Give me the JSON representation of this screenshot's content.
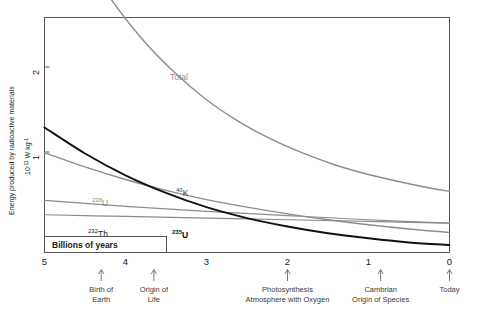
{
  "chart_data": {
    "type": "line",
    "title": "",
    "xlabel": "Billions of years",
    "ylabel": "Energy produced by radioactive materials",
    "ylabel_unit": "10 -11 W kg -1",
    "ylabel_unit_base": "10",
    "ylabel_unit_exp1": "-11",
    "ylabel_unit_mid": " W kg",
    "ylabel_unit_exp2": "-1",
    "x_direction": "decreasing",
    "xlim": [
      5,
      0
    ],
    "ylim": [
      0,
      2.8
    ],
    "xticks": [
      "5",
      "4",
      "3",
      "2",
      "1",
      "0"
    ],
    "xtick_values": [
      5,
      4,
      3,
      2,
      1,
      0
    ],
    "yticks": [
      "1",
      "2"
    ],
    "ytick_values": [
      1,
      2
    ],
    "grid": false,
    "legend": "inline-labels",
    "series": [
      {
        "name": "Total",
        "label": "Total",
        "color": "#8c8c8c",
        "width": 1.4,
        "x": [
          5.0,
          4.6,
          4.2,
          3.8,
          3.4,
          3.0,
          2.6,
          2.2,
          1.8,
          1.4,
          1.0,
          0.6,
          0.2,
          0.0
        ],
        "y": [
          4.55,
          3.7,
          3.05,
          2.55,
          2.15,
          1.82,
          1.56,
          1.35,
          1.18,
          1.04,
          0.93,
          0.84,
          0.76,
          0.73
        ]
      },
      {
        "name": "K-40",
        "label": "40 K",
        "label_sup": "40",
        "label_base": "K",
        "color": "#8c8c8c",
        "width": 1.4,
        "x": [
          5.0,
          4.5,
          4.0,
          3.5,
          3.0,
          2.5,
          2.0,
          1.5,
          1.0,
          0.5,
          0.0
        ],
        "y": [
          1.19,
          1.02,
          0.87,
          0.74,
          0.63,
          0.54,
          0.46,
          0.39,
          0.33,
          0.28,
          0.24
        ]
      },
      {
        "name": "U-235",
        "label": "235 U",
        "label_sup": "235",
        "label_base": "U",
        "color": "#111111",
        "width": 1.9,
        "x": [
          5.0,
          4.5,
          4.0,
          3.5,
          3.0,
          2.5,
          2.0,
          1.5,
          1.0,
          0.5,
          0.0
        ],
        "y": [
          1.49,
          1.18,
          0.92,
          0.71,
          0.54,
          0.41,
          0.31,
          0.23,
          0.17,
          0.12,
          0.09
        ]
      },
      {
        "name": "U-238",
        "label": "238 U",
        "label_sup": "238",
        "label_base": "U",
        "color": "#8c8c8c",
        "width": 1.2,
        "x": [
          5.0,
          4.0,
          3.0,
          2.0,
          1.0,
          0.0
        ],
        "y": [
          0.62,
          0.55,
          0.49,
          0.44,
          0.39,
          0.35
        ]
      },
      {
        "name": "Th-232",
        "label": "232 Th",
        "label_sup": "232",
        "label_base": "Th",
        "color": "#8c8c8c",
        "width": 1.2,
        "x": [
          5.0,
          4.0,
          3.0,
          2.0,
          1.0,
          0.0
        ],
        "y": [
          0.45,
          0.43,
          0.41,
          0.39,
          0.37,
          0.35
        ]
      }
    ],
    "annotations": [
      {
        "name": "birth-of-earth",
        "x": 4.3,
        "line1": "Birth of",
        "line2": "Earth"
      },
      {
        "name": "origin-of-life",
        "x": 3.65,
        "line1": "Origin of",
        "line2": "Life"
      },
      {
        "name": "photosynthesis",
        "x": 2.0,
        "line1": "Photosynthesis",
        "line2": "Atmosphere with Oxygen"
      },
      {
        "name": "cambrian",
        "x": 0.85,
        "line1": "Cambrian",
        "line2": "Origin of Species"
      },
      {
        "name": "today",
        "x": 0.0,
        "line1": "Today",
        "line2": ""
      }
    ]
  },
  "colors": {
    "gray_curve": "#8c8c8c",
    "black_curve": "#111111",
    "frame": "#555555",
    "text": "#1a1a1a",
    "annotation_text": "#3a3a3a"
  }
}
